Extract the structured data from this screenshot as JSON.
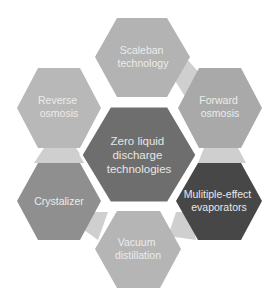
{
  "diagram": {
    "title": "Zero liquid discharge technologies",
    "center": {
      "id": "center",
      "lines": [
        "Zero liquid",
        "discharge",
        "technologies"
      ],
      "fill": "#6e6e6e",
      "text_color": "#e6e6e6"
    },
    "nodes": [
      {
        "id": "scaleban",
        "lines": [
          "Scaleban",
          "technology"
        ],
        "fill": "#b3b3b3",
        "text_color": "#ececec"
      },
      {
        "id": "forward-osmosis",
        "lines": [
          "Forward",
          "osmosis"
        ],
        "fill": "#a9a9a9",
        "text_color": "#ececec"
      },
      {
        "id": "multiple-effect",
        "lines": [
          "Mulitiple-effect",
          "evaporators"
        ],
        "fill": "#474747",
        "text_color": "#e8e8e8"
      },
      {
        "id": "vacuum-distillation",
        "lines": [
          "Vacuum",
          "distillation"
        ],
        "fill": "#b5b5b5",
        "text_color": "#ececec"
      },
      {
        "id": "crystalizer",
        "lines": [
          "Crystalizer"
        ],
        "fill": "#8f8f8f",
        "text_color": "#ececec"
      },
      {
        "id": "reverse-osmosis",
        "lines": [
          "Reverse",
          "osmosis"
        ],
        "fill": "#b8b8b8",
        "text_color": "#ececec"
      }
    ],
    "connector_color": "#cfcfcf"
  }
}
